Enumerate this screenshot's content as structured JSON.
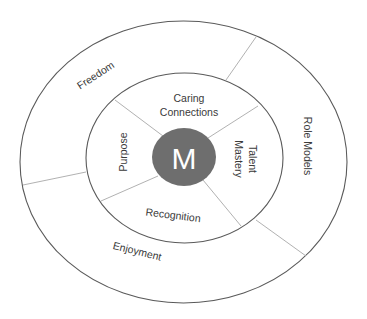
{
  "diagram": {
    "type": "concentric-rings",
    "center": {
      "label": "M",
      "fill": "#6e6e6e",
      "text_color": "#ffffff"
    },
    "inner_ring": {
      "segments": [
        {
          "id": "caring-connections",
          "lines": [
            "Caring",
            "Connections"
          ]
        },
        {
          "id": "talent-mastery",
          "lines": [
            "Talent",
            "Mastery"
          ]
        },
        {
          "id": "recognition",
          "lines": [
            "Recognition"
          ]
        },
        {
          "id": "purpose",
          "lines": [
            "Purpose"
          ]
        }
      ]
    },
    "outer_ring": {
      "segments": [
        {
          "id": "freedom",
          "lines": [
            "Freedom"
          ]
        },
        {
          "id": "role-models",
          "lines": [
            "Role Models"
          ]
        },
        {
          "id": "enjoyment",
          "lines": [
            "Enjoyment"
          ]
        }
      ]
    },
    "colors": {
      "ring_stroke": "#5a5a5a",
      "spoke_stroke": "#a8a8a8",
      "text": "#3a3a3a",
      "background": "#ffffff"
    }
  }
}
